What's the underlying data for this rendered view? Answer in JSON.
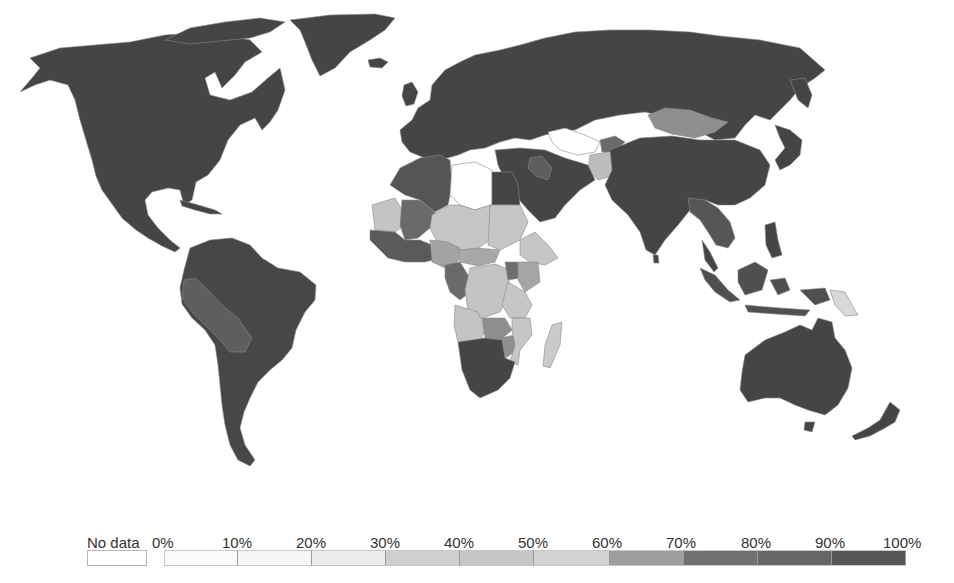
{
  "map": {
    "type": "choropleth",
    "projection": "world",
    "color_scale": "grayscale, light (0%) to dark (100%)",
    "no_data_color": "#ffffff",
    "regions": {
      "north_america": {
        "shade": "90-100%",
        "color": "#454545"
      },
      "greenland": {
        "shade": "90-100%",
        "color": "#454545"
      },
      "central_america_caribbean": {
        "shade": "90-100%",
        "color": "#454545"
      },
      "south_america": {
        "shade": "90-100%",
        "color": "#474747"
      },
      "peru_bolivia": {
        "shade": "70-80%",
        "color": "#5e5e5e"
      },
      "europe": {
        "shade": "90-100%",
        "color": "#454545"
      },
      "russia": {
        "shade": "90-100%",
        "color": "#454545"
      },
      "mongolia": {
        "shade": "60-70%",
        "color": "#8f8f8f"
      },
      "central_asia_stans": {
        "shade": "No data",
        "color": "#ffffff"
      },
      "afghanistan": {
        "shade": "30-40%",
        "color": "#bdbdbd"
      },
      "middle_east": {
        "shade": "90-100%",
        "color": "#454545"
      },
      "iraq": {
        "shade": "70-80%",
        "color": "#5e5e5e"
      },
      "china_india": {
        "shade": "90-100%",
        "color": "#454545"
      },
      "southeast_asia_mainland": {
        "shade": "70-90%",
        "color": "#565656"
      },
      "indonesia": {
        "shade": "80-90%",
        "color": "#4f4f4f"
      },
      "papua_new_guinea": {
        "shade": "20-30%",
        "color": "#d8d8d8"
      },
      "australia_nz": {
        "shade": "90-100%",
        "color": "#454545"
      },
      "north_africa_algeria": {
        "shade": "80-90%",
        "color": "#555555"
      },
      "libya": {
        "shade": "No data",
        "color": "#ffffff"
      },
      "egypt": {
        "shade": "90-100%",
        "color": "#454545"
      },
      "mauritania": {
        "shade": "30-40%",
        "color": "#c4c4c4"
      },
      "mali": {
        "shade": "70-80%",
        "color": "#6a6a6a"
      },
      "west_africa_coast": {
        "shade": "70-90%",
        "color": "#5a5a5a"
      },
      "niger_chad_sudan": {
        "shade": "30-40%",
        "color": "#c6c6c6"
      },
      "nigeria": {
        "shade": "50-60%",
        "color": "#a3a3a3"
      },
      "central_africa": {
        "shade": "40-50%",
        "color": "#bababa"
      },
      "cameroon_gabon": {
        "shade": "70-80%",
        "color": "#6a6a6a"
      },
      "drc_angola_zambia": {
        "shade": "30-40%",
        "color": "#c4c4c4"
      },
      "east_africa_ethiopia_tanzania": {
        "shade": "30-40%",
        "color": "#c6c6c6"
      },
      "kenya": {
        "shade": "50-60%",
        "color": "#a5a5a5"
      },
      "uganda": {
        "shade": "70-80%",
        "color": "#6e6e6e"
      },
      "zimbabwe_zambia_south": {
        "shade": "60-70%",
        "color": "#8e8e8e"
      },
      "mozambique_madagascar": {
        "shade": "30-40%",
        "color": "#cacaca"
      },
      "southern_africa": {
        "shade": "90-100%",
        "color": "#454545"
      }
    }
  },
  "legend": {
    "no_data_label": "No data",
    "no_data_color": "#ffffff",
    "ticks": [
      "0%",
      "10%",
      "20%",
      "30%",
      "40%",
      "50%",
      "60%",
      "70%",
      "80%",
      "90%",
      "100%"
    ],
    "bins": [
      {
        "range": "0-10%",
        "color": "#fbfbfb"
      },
      {
        "range": "10-20%",
        "color": "#f6f6f6"
      },
      {
        "range": "20-30%",
        "color": "#ececec"
      },
      {
        "range": "30-40%",
        "color": "#cfcfcf"
      },
      {
        "range": "40-50%",
        "color": "#c6c6c6"
      },
      {
        "range": "50-60%",
        "color": "#d3d3d3"
      },
      {
        "range": "60-70%",
        "color": "#9e9e9e"
      },
      {
        "range": "70-80%",
        "color": "#707070"
      },
      {
        "range": "80-90%",
        "color": "#666666"
      },
      {
        "range": "90-100%",
        "color": "#555555"
      }
    ]
  }
}
